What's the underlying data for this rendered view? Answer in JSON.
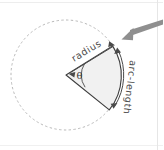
{
  "figure": {
    "background_color": "#ffffff",
    "labels": {
      "radius": "radius",
      "arc_length": "arc-length",
      "angle_symbol": "θ"
    },
    "colors": {
      "sector_fill": "#f0f0f0",
      "sector_stroke": "#3d3d3d",
      "dotted_circle": "#b9b9b9",
      "pointer_arrow": "#8c8c8c",
      "label_text": "#4a4a4a",
      "frame_line": "#e2e2e2"
    },
    "geometry": {
      "center_x": 66,
      "center_y": 75,
      "circle_radius": 55,
      "sector_start_angle_deg": -32,
      "sector_end_angle_deg": 38,
      "sector_vertex_top": [
        113,
        46
      ],
      "sector_vertex_bottom": [
        109,
        109
      ]
    },
    "annotations": {
      "pointer_from": [
        163,
        22
      ],
      "pointer_to": [
        122,
        39
      ]
    }
  }
}
